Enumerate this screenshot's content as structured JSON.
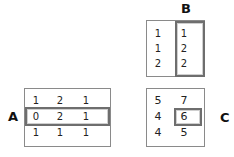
{
  "labels": {
    "a": "A",
    "b": "B",
    "c": "C"
  },
  "matrix_a": {
    "rows": [
      [
        "1",
        "2",
        "1"
      ],
      [
        "0",
        "2",
        "1"
      ],
      [
        "1",
        "1",
        "1"
      ]
    ],
    "highlighted_row": 1
  },
  "matrix_b": {
    "rows": [
      [
        "1",
        "1"
      ],
      [
        "1",
        "2"
      ],
      [
        "2",
        "2"
      ]
    ],
    "highlighted_column": 1
  },
  "matrix_c": {
    "rows": [
      [
        "5",
        "7"
      ],
      [
        "4",
        "6"
      ],
      [
        "4",
        "5"
      ]
    ],
    "highlighted_cell": [
      1,
      1
    ]
  },
  "colors": {
    "border": "#8a8a8a",
    "highlight": "#6e6e6e",
    "text": "#222222"
  }
}
